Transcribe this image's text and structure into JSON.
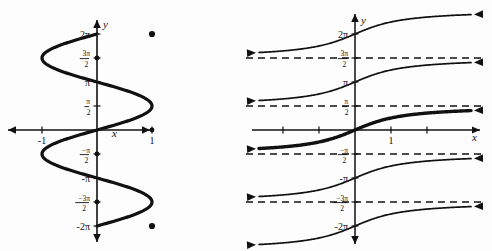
{
  "figure": {
    "title": "",
    "background_color": "#fdfdfd",
    "ink_color": "#111111",
    "panels": [
      {
        "id": "left-panel",
        "name": "inverse-sine-relation-graph",
        "description": "Graph of the inverse sine relation x = sin y",
        "axis_x_label": "x",
        "axis_y_label": "y",
        "x_ticks": [
          {
            "value": -1,
            "label": "-1"
          },
          {
            "value": 1,
            "label": "1"
          }
        ],
        "y_ticks": [
          {
            "value": 6.2832,
            "label": "2π",
            "kind": "plain"
          },
          {
            "value": 4.7124,
            "label": "3π/2",
            "kind": "fraction",
            "num": "3π",
            "den": "2"
          },
          {
            "value": 3.1416,
            "label": "π",
            "kind": "plain"
          },
          {
            "value": 1.5708,
            "label": "π/2",
            "kind": "fraction",
            "num": "π",
            "den": "2"
          },
          {
            "value": -1.5708,
            "label": "-π/2",
            "kind": "fraction",
            "num": "−π",
            "den": "2"
          },
          {
            "value": -3.1416,
            "label": "-π",
            "kind": "plain"
          },
          {
            "value": -4.7124,
            "label": "-3π/2",
            "kind": "fraction",
            "num": "−3π",
            "den": "2"
          },
          {
            "value": -6.2832,
            "label": "-2π",
            "kind": "plain"
          }
        ],
        "endpoints": [
          {
            "x": 1,
            "y": 6.2832,
            "style": "filled-dot"
          },
          {
            "x": 1,
            "y": -6.2832,
            "style": "filled-dot"
          }
        ],
        "curve_style": "bold",
        "curve_note": "sideways sinusoid, x = sin y, domain -1 to 1, range -2pi to 2pi"
      },
      {
        "id": "right-panel",
        "name": "inverse-tangent-relation-graph",
        "description": "Graph of the inverse tangent relation x = tan y with horizontal asymptotes",
        "axis_x_label": "x",
        "axis_y_label": "y",
        "x_ticks": [
          {
            "value": -2,
            "label": ""
          },
          {
            "value": -1,
            "label": ""
          },
          {
            "value": 1,
            "label": "1"
          },
          {
            "value": 2,
            "label": ""
          }
        ],
        "y_ticks": [
          {
            "value": 6.2832,
            "label": "2π",
            "kind": "plain"
          },
          {
            "value": 4.7124,
            "label": "3π/2",
            "kind": "fraction",
            "num": "3π",
            "den": "2"
          },
          {
            "value": 3.1416,
            "label": "π",
            "kind": "plain"
          },
          {
            "value": 1.5708,
            "label": "π/2",
            "kind": "fraction",
            "num": "π",
            "den": "2"
          },
          {
            "value": -1.5708,
            "label": "-π/2",
            "kind": "fraction",
            "num": "−π",
            "den": "2"
          },
          {
            "value": -3.1416,
            "label": "-π",
            "kind": "plain"
          },
          {
            "value": -4.7124,
            "label": "-3π/2",
            "kind": "fraction",
            "num": "−3π",
            "den": "2"
          },
          {
            "value": -6.2832,
            "label": "-2π",
            "kind": "plain"
          }
        ],
        "asymptotes": [
          {
            "y": 4.7124,
            "label": "3π/2",
            "style": "dashed"
          },
          {
            "y": 1.5708,
            "label": "π/2",
            "style": "dashed"
          },
          {
            "y": -1.5708,
            "label": "-π/2",
            "style": "dashed"
          },
          {
            "y": -4.7124,
            "label": "-3π/2",
            "style": "dashed"
          }
        ],
        "branches": [
          {
            "center_y": 6.2832,
            "style": "normal",
            "note": "branch approaching 3pi/2 from above, rising to 2pi and beyond"
          },
          {
            "center_y": 3.1416,
            "style": "normal",
            "note": "branch between pi/2 and 3pi/2 through (0, pi)"
          },
          {
            "center_y": 0,
            "style": "bold",
            "note": "principal branch between -pi/2 and pi/2 through origin"
          },
          {
            "center_y": -3.1416,
            "style": "normal",
            "note": "branch between -3pi/2 and -pi/2 through (0, -pi)"
          },
          {
            "center_y": -6.2832,
            "style": "normal",
            "note": "branch below -3pi/2 through (0, -2pi)"
          }
        ]
      }
    ]
  },
  "chart_data": {
    "type": "line",
    "title": "",
    "panels": [
      {
        "name": "x = sin y (inverse sine relation)",
        "xlabel": "x",
        "ylabel": "y",
        "xlim": [
          -1.6,
          1.6
        ],
        "ylim": [
          -7.2,
          7.2
        ],
        "xticks": [
          -1,
          1
        ],
        "xticklabels": [
          "-1",
          "1"
        ],
        "yticks": [
          -6.2832,
          -4.7124,
          -3.1416,
          -1.5708,
          1.5708,
          3.1416,
          4.7124,
          6.2832
        ],
        "yticklabels": [
          "-2π",
          "-3π/2",
          "-π",
          "-π/2",
          "π/2",
          "π",
          "3π/2",
          "2π"
        ],
        "grid": false,
        "legend": "none",
        "series": [
          {
            "name": "x = sin y",
            "style": "bold",
            "points_x": [
              1.0,
              0.866,
              0.5,
              0.0,
              -0.5,
              -0.866,
              -1.0,
              -0.866,
              -0.5,
              0.0,
              0.5,
              0.866,
              1.0,
              0.866,
              0.5,
              0.0,
              -0.5,
              -0.866,
              -1.0,
              -0.866,
              -0.5,
              0.0,
              0.5,
              0.866,
              1.0
            ],
            "points_y": [
              6.2832,
              5.7596,
              5.236,
              4.7124,
              4.1888,
              3.6652,
              3.1416,
              2.618,
              2.0944,
              1.5708,
              1.0472,
              0.5236,
              0.0,
              -0.5236,
              -1.0472,
              -1.5708,
              -2.0944,
              -2.618,
              -3.1416,
              -3.6652,
              -4.1888,
              -4.7124,
              -5.236,
              -5.7596,
              -6.2832
            ],
            "endpoints": [
              [
                1,
                6.2832
              ],
              [
                1,
                -6.2832
              ]
            ]
          }
        ]
      },
      {
        "name": "x = tan y (inverse tangent relation)",
        "xlabel": "x",
        "ylabel": "y",
        "xlim": [
          -3.2,
          3.2
        ],
        "ylim": [
          -7.2,
          7.2
        ],
        "xticks": [
          -2,
          -1,
          1,
          2
        ],
        "xticklabels": [
          "",
          "",
          "1",
          ""
        ],
        "yticks": [
          -6.2832,
          -4.7124,
          -3.1416,
          -1.5708,
          1.5708,
          3.1416,
          4.7124,
          6.2832
        ],
        "yticklabels": [
          "-2π",
          "-3π/2",
          "-π",
          "-π/2",
          "π/2",
          "π",
          "3π/2",
          "2π"
        ],
        "grid": false,
        "legend": "none",
        "asymptote_ys": [
          4.7124,
          1.5708,
          -1.5708,
          -4.7124
        ],
        "series": [
          {
            "name": "branch k=2",
            "style": "normal",
            "center_y": 6.2832
          },
          {
            "name": "branch k=1",
            "style": "normal",
            "center_y": 3.1416
          },
          {
            "name": "principal branch k=0",
            "style": "bold",
            "center_y": 0
          },
          {
            "name": "branch k=-1",
            "style": "normal",
            "center_y": -3.1416
          },
          {
            "name": "branch k=-2",
            "style": "normal",
            "center_y": -6.2832
          }
        ]
      }
    ]
  }
}
